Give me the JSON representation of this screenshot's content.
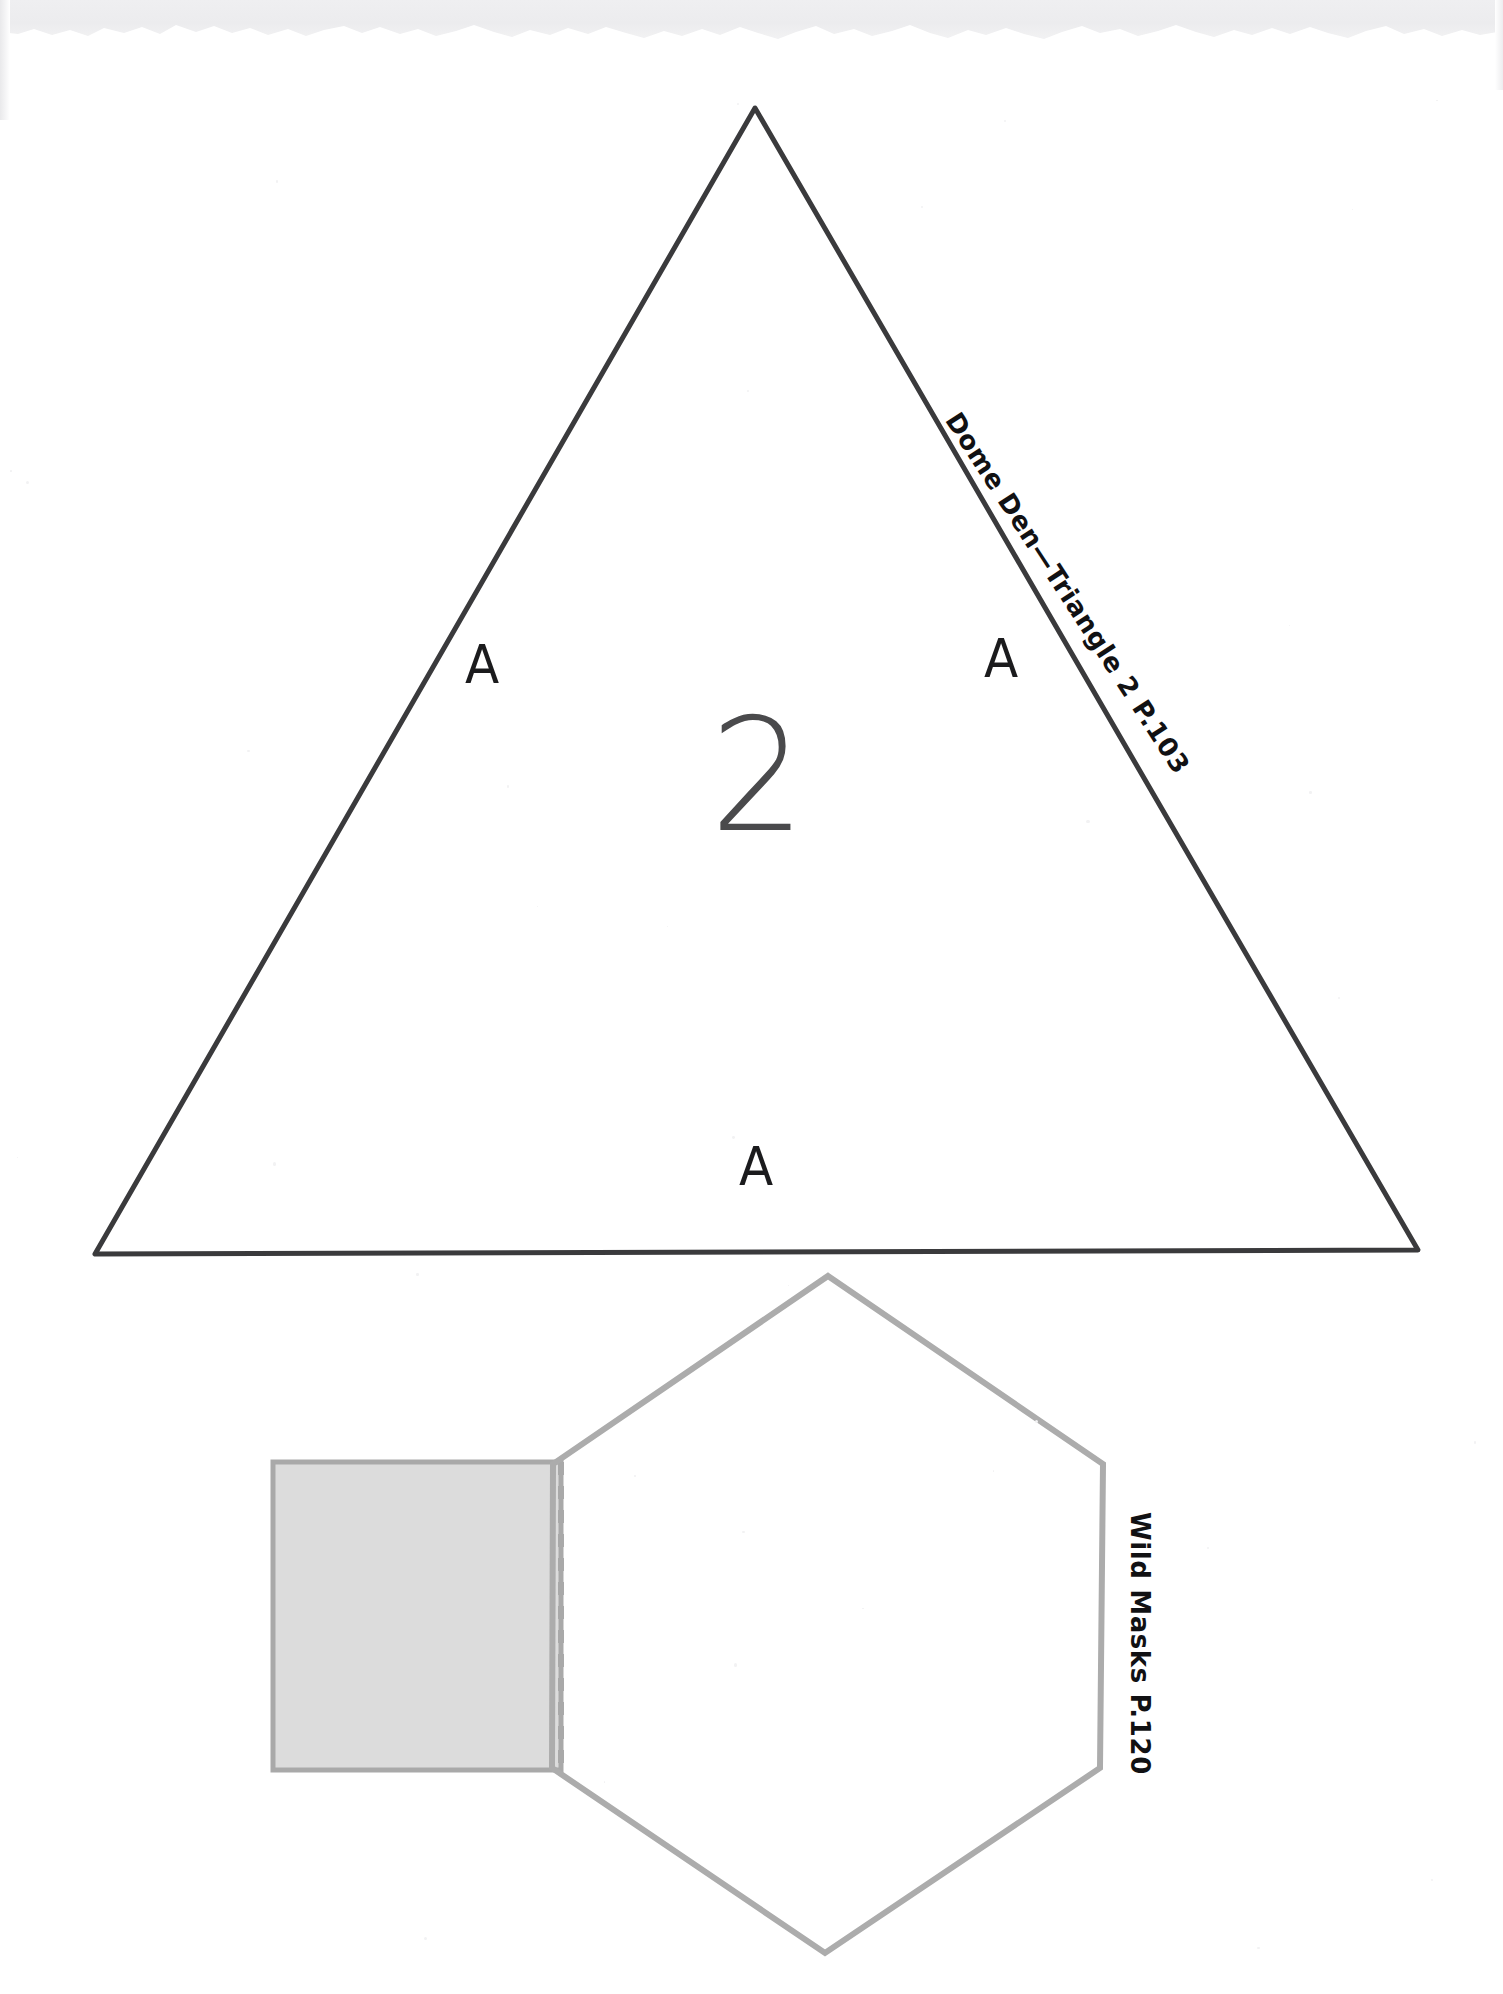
{
  "page": {
    "background_color": "#ffffff",
    "width": 1503,
    "height": 1994
  },
  "scan": {
    "top_band_color": "#ececee",
    "ghost_text": "",
    "has_torn_top_edge": true
  },
  "triangle_template": {
    "name": "Dome Den Triangle 2",
    "edge_label": "Dome Den—Triangle 2  P.103",
    "center_number": "2",
    "stroke_color": "#3a3a3c",
    "stroke_width": 5,
    "fill": "none",
    "vertices": {
      "apex": [
        755,
        108
      ],
      "bottom_left": [
        95,
        1254
      ],
      "bottom_right": [
        1418,
        1250
      ]
    },
    "side_labels": [
      {
        "text": "A",
        "side": "left",
        "x": 481,
        "y": 672
      },
      {
        "text": "A",
        "side": "right",
        "x": 1000,
        "y": 666
      },
      {
        "text": "A",
        "side": "bottom",
        "x": 755,
        "y": 1174
      }
    ]
  },
  "hexagon_template": {
    "name": "Wild Masks",
    "edge_label": "Wild Masks  P.120",
    "stroke_color": "#acacac",
    "stroke_width": 6,
    "fill": "none",
    "vertices": [
      [
        828,
        1276
      ],
      [
        1103,
        1464
      ],
      [
        1100,
        1768
      ],
      [
        825,
        1953
      ],
      [
        552,
        1768
      ],
      [
        553,
        1464
      ]
    ]
  },
  "tab_flap": {
    "name": "glue tab",
    "fill_color": "#dcdcdc",
    "stroke_color": "#a9a9a9",
    "stroke_width": 5,
    "fold_line_style": "dashed",
    "fold_line_color": "#a9a9a9",
    "rect": {
      "x": 273,
      "y": 1462,
      "width": 288,
      "height": 308
    }
  }
}
